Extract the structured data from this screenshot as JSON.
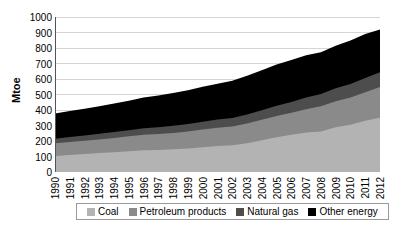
{
  "chart_data": {
    "type": "area",
    "stacked": true,
    "title": "",
    "xlabel": "",
    "ylabel": "Mtoe",
    "ylim": [
      0,
      1000
    ],
    "yticks": [
      0,
      100,
      200,
      300,
      400,
      500,
      600,
      700,
      800,
      900,
      1000
    ],
    "grid": true,
    "legend_position": "bottom",
    "categories": [
      "1990",
      "1991",
      "1992",
      "1993",
      "1994",
      "1995",
      "1996",
      "1997",
      "1998",
      "1999",
      "2000",
      "2001",
      "2002",
      "2003",
      "2004",
      "2005",
      "2006",
      "2007",
      "2008",
      "2009",
      "2010",
      "2011",
      "2012"
    ],
    "series": [
      {
        "name": "Coal",
        "color": "#b3b3b3",
        "values": [
          103,
          110,
          116,
          122,
          128,
          134,
          140,
          142,
          146,
          152,
          160,
          168,
          172,
          185,
          205,
          225,
          240,
          255,
          262,
          288,
          305,
          330,
          350
        ]
      },
      {
        "name": "Petroleum products",
        "color": "#8a8a8a",
        "values": [
          82,
          84,
          86,
          88,
          92,
          96,
          100,
          103,
          106,
          110,
          115,
          118,
          122,
          128,
          132,
          136,
          142,
          150,
          162,
          168,
          175,
          185,
          198
        ]
      },
      {
        "name": "Natural gas",
        "color": "#4d4d4d",
        "values": [
          30,
          32,
          34,
          36,
          38,
          40,
          42,
          44,
          46,
          48,
          50,
          52,
          54,
          58,
          62,
          66,
          70,
          76,
          80,
          84,
          88,
          92,
          95
        ]
      },
      {
        "name": "Other energy",
        "color": "#000000",
        "values": [
          162,
          168,
          172,
          178,
          184,
          190,
          198,
          205,
          212,
          218,
          225,
          232,
          240,
          250,
          258,
          266,
          270,
          272,
          268,
          275,
          280,
          283,
          277
        ]
      }
    ],
    "cumulative_totals": [
      377,
      394,
      408,
      424,
      442,
      460,
      480,
      494,
      510,
      528,
      550,
      570,
      588,
      621,
      657,
      693,
      722,
      753,
      772,
      815,
      848,
      890,
      920
    ]
  }
}
